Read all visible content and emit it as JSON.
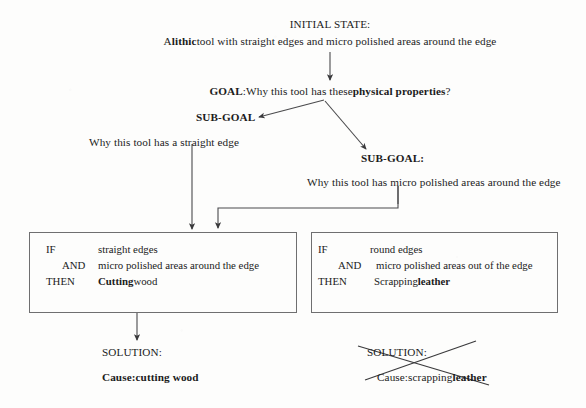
{
  "diagram": {
    "title_node": {
      "label": "INITIAL STATE:",
      "description": "A lithic tool with straight edges and micro polished areas around the edge",
      "description_bold_prefix": "A ",
      "description_bold_word": "lithic",
      "description_rest": " tool with straight edges and micro polished areas around the edge"
    },
    "goal": {
      "label": "GOAL",
      "separator": ": ",
      "question_start": "Why this tool has these ",
      "question_bold": "physical properties",
      "question_end": "?"
    },
    "subgoal_left": {
      "label": "SUB-GOAL",
      "colon": "",
      "text": "Why this tool has a straight edge"
    },
    "subgoal_right": {
      "label": "SUB-GOAL:",
      "text": "Why this tool has micro polished areas around the edge"
    },
    "rule_left": {
      "if_label": "IF",
      "if_value": "straight edges",
      "and_label": "AND",
      "and_value": "micro polished areas around the edge",
      "then_label": "THEN",
      "then_value_bold": "Cutting",
      "then_value_rest": " wood"
    },
    "rule_right": {
      "if_label": "IF",
      "if_value": "round edges",
      "and_label": "AND",
      "and_value": "micro polished areas out of the edge",
      "then_label": "THEN",
      "then_value_rest": "Scrapping ",
      "then_value_bold": "leather"
    },
    "solution_left": {
      "label": "SOLUTION:",
      "cause_prefix": "Cause: ",
      "cause_value": "cutting wood"
    },
    "solution_right": {
      "label": "SOLUTION:",
      "cause_prefix": "Cause: ",
      "cause_value_plain": "scrapping ",
      "cause_value_bold": "leather",
      "struck_out": "true"
    },
    "colors": {
      "ink": "#1b1b1b",
      "line": "#4a4a4c",
      "box_border": "#6f6f70",
      "page_background": "#fdfdfc"
    }
  }
}
